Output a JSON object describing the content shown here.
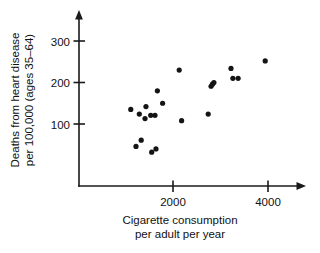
{
  "chart_data": {
    "type": "scatter",
    "title": "",
    "xlabel": "Cigarette consumption per adult per year",
    "xlabel_line1": "Cigarette consumption",
    "xlabel_line2": "per adult per year",
    "ylabel": "Deaths from heart disease per 100,000 (ages 35–64)",
    "ylabel_line1": "Deaths from heart disease",
    "ylabel_line2": "per 100,000 (ages 35–64)",
    "xlim": [
      0,
      4600
    ],
    "ylim": [
      0,
      350
    ],
    "xticks": [
      2000,
      4000
    ],
    "xtick_labels": [
      "2000",
      "4000"
    ],
    "yticks": [
      100,
      200,
      300
    ],
    "ytick_labels": [
      "100",
      "200",
      "300"
    ],
    "grid": false,
    "legend": false,
    "marker_color": "#141414",
    "axis_color": "#1a1a1a",
    "points": [
      {
        "x": 1090,
        "y": 135
      },
      {
        "x": 1270,
        "y": 124
      },
      {
        "x": 1410,
        "y": 142
      },
      {
        "x": 1390,
        "y": 113
      },
      {
        "x": 1510,
        "y": 121
      },
      {
        "x": 1600,
        "y": 121
      },
      {
        "x": 1650,
        "y": 180
      },
      {
        "x": 1760,
        "y": 150
      },
      {
        "x": 2110,
        "y": 230
      },
      {
        "x": 2160,
        "y": 108
      },
      {
        "x": 2720,
        "y": 124
      },
      {
        "x": 2780,
        "y": 191
      },
      {
        "x": 2810,
        "y": 196
      },
      {
        "x": 2840,
        "y": 200
      },
      {
        "x": 3200,
        "y": 234
      },
      {
        "x": 3240,
        "y": 210
      },
      {
        "x": 3350,
        "y": 210
      },
      {
        "x": 3920,
        "y": 252
      },
      {
        "x": 1200,
        "y": 46
      },
      {
        "x": 1310,
        "y": 61
      },
      {
        "x": 1530,
        "y": 32
      },
      {
        "x": 1620,
        "y": 40
      }
    ]
  }
}
